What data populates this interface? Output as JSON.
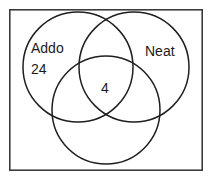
{
  "diagram": {
    "type": "venn",
    "title": "",
    "background_color": "#ffffff",
    "frame": {
      "name": "outer-frame",
      "stroke_color": "#3c3c3c",
      "x": 9,
      "y": 9,
      "width": 193,
      "height": 161
    },
    "circle_stroke_color": "#1f1f1f",
    "circles": [
      {
        "id": "left",
        "label": "Addo",
        "cx": 78,
        "cy": 67,
        "r": 55
      },
      {
        "id": "right",
        "label": "Neat",
        "cx": 134,
        "cy": 67,
        "r": 55
      },
      {
        "id": "bottom",
        "label": "",
        "cx": 106,
        "cy": 110,
        "r": 54
      }
    ],
    "labels": [
      {
        "name": "left-circle-label",
        "text": "Addo",
        "x": 31,
        "y": 53
      },
      {
        "name": "right-circle-label",
        "text": "Neat",
        "x": 145,
        "y": 56
      }
    ],
    "values": [
      {
        "name": "left-only-count",
        "text": "24",
        "x": 31,
        "y": 73
      },
      {
        "name": "center-intersection-count",
        "text": "4",
        "x": 101,
        "y": 93
      }
    ]
  }
}
